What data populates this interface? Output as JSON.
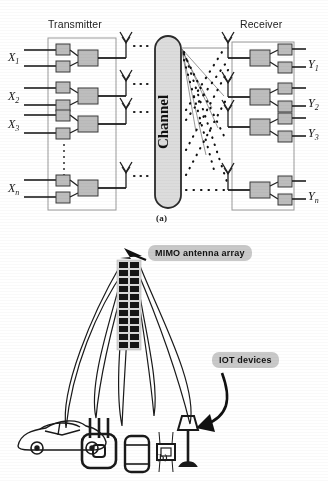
{
  "figure": {
    "caption_a": "(a)",
    "caption_b": "(b)"
  },
  "panel_a": {
    "transmitter_title": "Transmitter",
    "receiver_title": "Receiver",
    "channel_label": "Channel",
    "inputs": [
      {
        "base": "X",
        "sub": "1"
      },
      {
        "base": "X",
        "sub": "2"
      },
      {
        "base": "X",
        "sub": "3"
      },
      {
        "base": "X",
        "sub": "n"
      }
    ],
    "outputs": [
      {
        "base": "Y",
        "sub": "1"
      },
      {
        "base": "Y",
        "sub": "2"
      },
      {
        "base": "Y",
        "sub": "3"
      },
      {
        "base": "Y",
        "sub": "n"
      }
    ],
    "tx_antenna_count": 4,
    "rx_antenna_count": 4,
    "ellipsis_glyph": "...",
    "colors": {
      "block_fill": "#bdbdbd",
      "block_stroke": "#3a3a3a",
      "channel_fill": "#dcdcdc",
      "channel_stroke": "#2b2b2b",
      "panel_stroke": "#9a9a9a",
      "wire": "#1f1f1f"
    }
  },
  "panel_b": {
    "mimo_tag": "MIMO antenna array",
    "iot_tag": "IOT devices",
    "array": {
      "rows": 11,
      "cols": 2,
      "element_fill": "#151515",
      "panel_fill": "#d8d8d8"
    },
    "beam_count": 5,
    "devices": [
      {
        "name": "car"
      },
      {
        "name": "router"
      },
      {
        "name": "smartphone"
      },
      {
        "name": "smartwatch"
      },
      {
        "name": "lamp"
      }
    ],
    "colors": {
      "tag_fill": "#c9c9c9",
      "outline": "#1a1a1a",
      "arrow": "#111111"
    }
  }
}
